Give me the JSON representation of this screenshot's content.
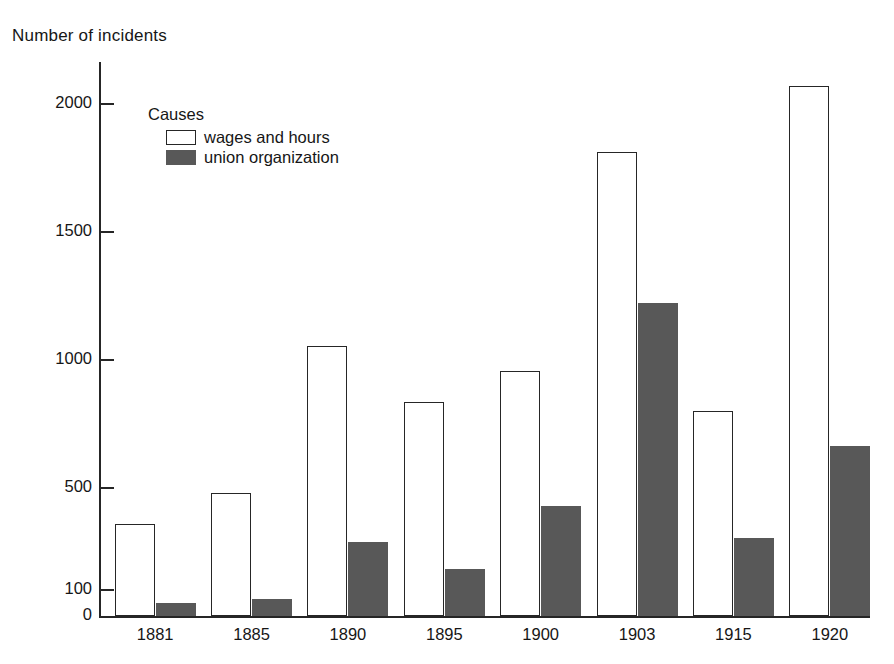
{
  "chart_data": {
    "type": "bar",
    "title": "",
    "ylabel": "Number of incidents",
    "xlabel": "",
    "categories": [
      "1881",
      "1885",
      "1890",
      "1895",
      "1900",
      "1903",
      "1915",
      "1920"
    ],
    "series": [
      {
        "name": "wages and hours",
        "color": "#ffffff",
        "values": [
          360,
          480,
          1055,
          835,
          955,
          1810,
          800,
          2070
        ]
      },
      {
        "name": "union organization",
        "color": "#585858",
        "values": [
          50,
          65,
          290,
          185,
          430,
          1220,
          305,
          665
        ]
      }
    ],
    "ylim": [
      0,
      2200
    ],
    "yticks": [
      0,
      100,
      500,
      1000,
      1500,
      2000
    ],
    "ytick_labels": [
      "0",
      "100",
      "500",
      "1000",
      "1500",
      "2000"
    ],
    "grid": false,
    "legend": {
      "title": "Causes",
      "position": "inside-top-left",
      "entries": [
        {
          "label": "wages and hours",
          "swatch": "open-rectangle"
        },
        {
          "label": "union organization",
          "swatch": "filled-rectangle"
        }
      ]
    },
    "axis_color": "#262626"
  }
}
